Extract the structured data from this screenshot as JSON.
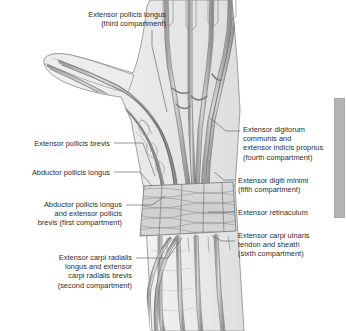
{
  "document": {
    "title": "Extensor compartments of the wrist",
    "background_color": "#ffffff",
    "ink_color": "#4a4a4a",
    "text_color": "#2b2b2b"
  },
  "labels": [
    {
      "id": "extensor-pollicis-longus",
      "text": "Extensor pollicis longus\n(third compartment)",
      "align": "right",
      "x": 38,
      "y": 10,
      "width": 128,
      "leader": [
        [
          152,
          30
        ],
        [
          152,
          46
        ],
        [
          167,
          112
        ]
      ]
    },
    {
      "id": "extensor-pollicis-brevis",
      "text": "Extensor pollicis brevis",
      "align": "right",
      "x": 14,
      "y": 139,
      "width": 96,
      "leader": [
        [
          114,
          143
        ],
        [
          143,
          143
        ],
        [
          155,
          176
        ]
      ]
    },
    {
      "id": "abductor-pollicis-longus",
      "text": "Abductor pollicis longus",
      "align": "right",
      "x": 14,
      "y": 168,
      "width": 96,
      "leader": [
        [
          114,
          172
        ],
        [
          140,
          172
        ],
        [
          152,
          186
        ]
      ]
    },
    {
      "id": "abductor-pollicis-longus-and-extensor-pollicis-brevis",
      "text": "Abductor pollicis longus\nand extensor pollicis\nbrevis (first compartment)",
      "align": "right",
      "x": 10,
      "y": 200,
      "width": 112,
      "leader": [
        [
          126,
          205
        ],
        [
          152,
          205
        ],
        [
          165,
          196
        ]
      ]
    },
    {
      "id": "extensor-carpi-radialis-longus-and-brevis",
      "text": "Extensor carpi radialis\nlongus and extensor\ncarpi radialis brevis\n(second compartment)",
      "align": "right",
      "x": 28,
      "y": 253,
      "width": 104,
      "leader": [
        [
          136,
          258
        ],
        [
          168,
          258
        ],
        [
          182,
          238
        ]
      ]
    },
    {
      "id": "extensor-digitorum-communis-and-extensor-indicis-proprius",
      "text": "Extensor digitorum\ncommunis and\nextensor indicis proprius\n(fourth compartment)",
      "align": "left",
      "x": 243,
      "y": 125,
      "width": 102,
      "leader": [
        [
          240,
          131
        ],
        [
          226,
          131
        ],
        [
          210,
          118
        ]
      ]
    },
    {
      "id": "extensor-digiti-minimi",
      "text": "Extensor digiti minimi\n(fifth compartment)",
      "align": "left",
      "x": 238,
      "y": 176,
      "width": 102,
      "leader": [
        [
          235,
          180
        ],
        [
          224,
          180
        ],
        [
          214,
          172
        ]
      ]
    },
    {
      "id": "extensor-retinaculum",
      "text": "Extensor retinaculum",
      "align": "left",
      "x": 238,
      "y": 208,
      "width": 102,
      "leader": [
        [
          235,
          212
        ],
        [
          218,
          212
        ],
        [
          208,
          212
        ]
      ]
    },
    {
      "id": "extensor-carpi-ulnaris-tendon-and-sheath",
      "text": "Extensor carpi ulnaris\ntendon and sheath\n(sixth compartment)",
      "align": "left",
      "x": 238,
      "y": 231,
      "width": 102,
      "leader": [
        [
          235,
          241
        ],
        [
          222,
          241
        ],
        [
          212,
          236
        ]
      ]
    }
  ],
  "scrollbar": {
    "orientation": "vertical",
    "thumb_top": 98,
    "thumb_height": 120,
    "thumb_color": "#b4b4b4"
  }
}
